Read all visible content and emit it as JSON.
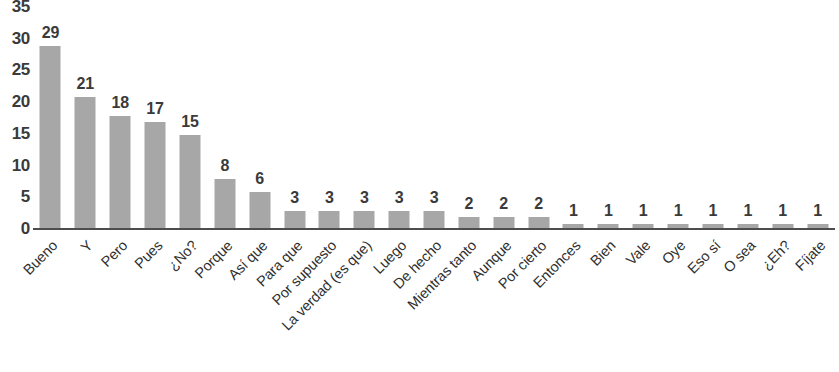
{
  "chart_data": {
    "type": "bar",
    "title": "",
    "subtitle": "",
    "xlabel": "",
    "ylabel": "",
    "ylim": [
      0,
      35
    ],
    "y_ticks": [
      "0",
      "5",
      "10",
      "15",
      "20",
      "25",
      "30",
      "35"
    ],
    "y_tick_values": [
      0,
      5,
      10,
      15,
      20,
      25,
      30,
      35
    ],
    "grid": false,
    "legend": false,
    "bar_color": "#a7a7a7",
    "axis_color": "#4d4d4d",
    "label_color": "#3a3a3a",
    "data_labels": true,
    "categories": [
      "Bueno",
      "Y",
      "Pero",
      "Pues",
      "¿No?",
      "Porque",
      "Así que",
      "Para que",
      "Por supuesto",
      "La verdad (es que)",
      "Luego",
      "De hecho",
      "Mientras tanto",
      "Aunque",
      "Por cierto",
      "Entonces",
      "Bien",
      "Vale",
      "Oye",
      "Eso sí",
      "O sea",
      "¿Eh?",
      "Fíjate"
    ],
    "values": [
      29,
      21,
      18,
      17,
      15,
      8,
      6,
      3,
      3,
      3,
      3,
      3,
      2,
      2,
      2,
      1,
      1,
      1,
      1,
      1,
      1,
      1,
      1
    ],
    "value_labels": [
      "29",
      "21",
      "18",
      "17",
      "15",
      "8",
      "6",
      "3",
      "3",
      "3",
      "3",
      "3",
      "2",
      "2",
      "2",
      "1",
      "1",
      "1",
      "1",
      "1",
      "1",
      "1",
      "1"
    ]
  }
}
